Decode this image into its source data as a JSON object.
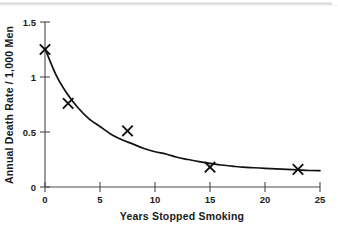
{
  "chart_data": {
    "type": "scatter",
    "title": "",
    "xlabel": "Years Stopped Smoking",
    "ylabel": "Annual Death Rate / 1,000 Men",
    "xlim": [
      0,
      25
    ],
    "ylim": [
      0,
      1.5
    ],
    "grid": false,
    "legend": "none",
    "xticks": [
      0,
      5,
      10,
      15,
      20,
      25
    ],
    "xtick_labels": [
      "0",
      "5",
      "10",
      "15",
      "20",
      "25"
    ],
    "yticks": [
      0,
      0.5,
      1,
      1.5
    ],
    "ytick_labels": [
      "0",
      "0.5",
      "1",
      "1.5"
    ],
    "marker": "x",
    "points": [
      {
        "x": 0,
        "y": 1.25
      },
      {
        "x": 2.1,
        "y": 0.76
      },
      {
        "x": 7.5,
        "y": 0.51
      },
      {
        "x": 15.0,
        "y": 0.18
      },
      {
        "x": 23.0,
        "y": 0.16
      }
    ],
    "fit_curve": {
      "type": "exponential-decay",
      "description": "smooth fitted decay curve through the plotted points",
      "x": [
        0,
        1,
        2,
        3,
        4,
        5,
        6,
        7,
        8,
        9,
        10,
        11,
        12,
        13,
        14,
        15,
        16,
        17,
        18,
        19,
        20,
        21,
        22,
        23,
        24,
        25
      ],
      "y": [
        1.26,
        1.02,
        0.85,
        0.72,
        0.62,
        0.55,
        0.48,
        0.43,
        0.39,
        0.35,
        0.32,
        0.3,
        0.27,
        0.25,
        0.23,
        0.215,
        0.2,
        0.19,
        0.18,
        0.175,
        0.17,
        0.165,
        0.16,
        0.155,
        0.15,
        0.148
      ]
    },
    "marker_color": "#111111",
    "curve_color": "#111111",
    "axis_color": "#4a4a4a",
    "background_color": "#ffffff"
  },
  "axes": {
    "x_title": "Years Stopped Smoking",
    "y_title": "Annual Death Rate / 1,000 Men",
    "x_tick_0": "0",
    "x_tick_1": "5",
    "x_tick_2": "10",
    "x_tick_3": "15",
    "x_tick_4": "20",
    "x_tick_5": "25",
    "y_tick_0": "0",
    "y_tick_1": "0.5",
    "y_tick_2": "1",
    "y_tick_3": "1.5"
  }
}
